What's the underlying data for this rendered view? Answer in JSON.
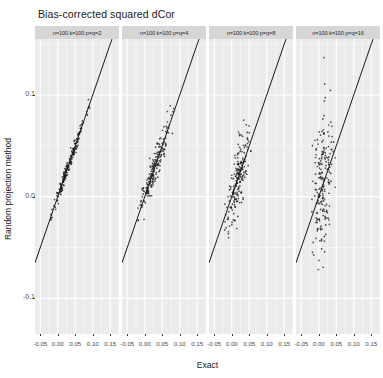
{
  "chart_data": {
    "type": "scatter",
    "title": "Bias-corrected squared dCor",
    "xlabel": "Exact",
    "ylabel": "Random projection method",
    "grid": true,
    "legend": "none",
    "xlim": [
      -0.065,
      0.175
    ],
    "ylim": [
      -0.135,
      0.155
    ],
    "xticks": [
      -0.05,
      0.0,
      0.05,
      0.1,
      0.15
    ],
    "xticklabels": [
      "-0.05",
      "0.00",
      "0.05",
      "0.10",
      "0.15"
    ],
    "yticks": [
      -0.1,
      0.0,
      0.1
    ],
    "yticklabels": [
      "-0.1",
      "0.0",
      "0.1"
    ],
    "reference_line": {
      "slope": 1,
      "intercept": 0,
      "color": "#000000"
    },
    "point_color": "#1a1a1a",
    "panel_background": "#ebebeb",
    "grid_color": "#ffffff",
    "strip_background": "#d6d6d6",
    "panels": [
      {
        "label": "n=100 k=100 p=q=2",
        "n_points": 200,
        "noise_sd": 0.004,
        "x_center": 0.032,
        "x_sd": 0.024,
        "seed": 11
      },
      {
        "label": "n=100 k=100 p=q=4",
        "n_points": 200,
        "noise_sd": 0.0085,
        "x_center": 0.026,
        "x_sd": 0.021,
        "seed": 27
      },
      {
        "label": "n=100 k=100 p=q=8",
        "n_points": 200,
        "noise_sd": 0.017,
        "x_center": 0.018,
        "x_sd": 0.017,
        "seed": 43
      },
      {
        "label": "n=100 k=100 p=q=16",
        "n_points": 200,
        "noise_sd": 0.032,
        "x_center": 0.012,
        "x_sd": 0.014,
        "seed": 59
      }
    ]
  }
}
